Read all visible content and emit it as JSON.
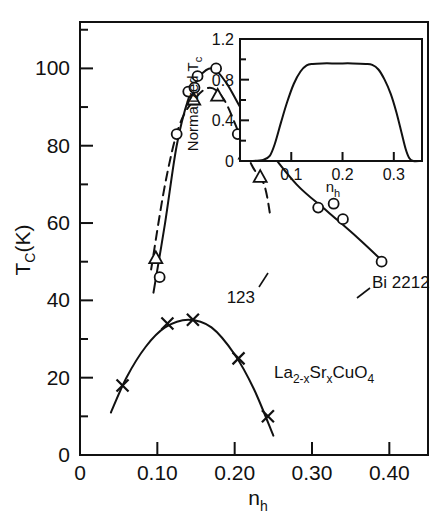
{
  "figure": {
    "background": "#ffffff",
    "ink": "#111111"
  },
  "main_axes": {
    "xlabel": "n",
    "xlabel_sub": "h",
    "ylabel": "T",
    "ylabel_sub": "C",
    "ylabel_unit": "(K)",
    "xticks": [
      "0",
      "0.10",
      "0.20",
      "0.30",
      "0.40"
    ],
    "xtick_values": [
      0,
      0.1,
      0.2,
      0.3,
      0.4
    ],
    "yticks": [
      "0",
      "20",
      "40",
      "60",
      "80",
      "100"
    ],
    "ytick_values": [
      0,
      20,
      40,
      60,
      80,
      100
    ],
    "xlim": [
      0,
      0.45
    ],
    "ylim": [
      0,
      112
    ],
    "minor_ticks": true,
    "grid": false,
    "frame": "box"
  },
  "annotations": {
    "bi2212": "Bi 2212",
    "y123": "123",
    "lsco_parts": [
      "La",
      "2-x",
      "Sr",
      "x",
      "CuO",
      "4"
    ],
    "lsco_plain": "La2-xSrxCuO4"
  },
  "inset_axes": {
    "ylabel": "Normalized T",
    "ylabel_sub": "c",
    "xlabel": "n",
    "xlabel_sub": "h",
    "xticks": [
      "0.1",
      "0.2",
      "0.3"
    ],
    "xtick_values": [
      0.1,
      0.2,
      0.3
    ],
    "yticks": [
      "0",
      "0.4",
      "0.8",
      "1.2"
    ],
    "ytick_values": [
      0,
      0.4,
      0.8,
      1.2
    ],
    "xlim": [
      0,
      0.355
    ],
    "ylim": [
      0,
      1.2
    ],
    "grid": false,
    "frame": "box"
  },
  "chart_data": [
    {
      "type": "scatter",
      "id": "main",
      "title": "",
      "xlabel": "n_h",
      "ylabel": "T_C (K)",
      "xlim": [
        0,
        0.45
      ],
      "ylim": [
        0,
        112
      ],
      "grid": false,
      "legend": "annotated-inline",
      "series": [
        {
          "name": "Bi 2212",
          "marker": "open-circle",
          "line": "solid",
          "points": [
            [
              0.103,
              46
            ],
            [
              0.125,
              83
            ],
            [
              0.14,
              94
            ],
            [
              0.148,
              95
            ],
            [
              0.152,
              98
            ],
            [
              0.176,
              100
            ],
            [
              0.204,
              83
            ],
            [
              0.308,
              64
            ],
            [
              0.328,
              65
            ],
            [
              0.34,
              61
            ],
            [
              0.39,
              50
            ]
          ],
          "curve": [
            [
              0.095,
              42
            ],
            [
              0.11,
              60
            ],
            [
              0.125,
              80
            ],
            [
              0.14,
              92
            ],
            [
              0.155,
              98
            ],
            [
              0.172,
              100
            ],
            [
              0.19,
              96
            ],
            [
              0.21,
              89
            ],
            [
              0.24,
              80
            ],
            [
              0.28,
              70
            ],
            [
              0.32,
              63
            ],
            [
              0.36,
              56
            ],
            [
              0.392,
              50
            ]
          ]
        },
        {
          "name": "123",
          "marker": "open-triangle",
          "line": "dashed",
          "points": [
            [
              0.098,
              51
            ],
            [
              0.147,
              92
            ],
            [
              0.178,
              93
            ],
            [
              0.214,
              78
            ],
            [
              0.233,
              72
            ]
          ],
          "curve": [
            [
              0.092,
              48
            ],
            [
              0.11,
              70
            ],
            [
              0.128,
              85
            ],
            [
              0.148,
              92
            ],
            [
              0.168,
              95
            ],
            [
              0.186,
              92
            ],
            [
              0.204,
              84
            ],
            [
              0.222,
              75
            ],
            [
              0.238,
              70
            ],
            [
              0.246,
              62
            ]
          ]
        },
        {
          "name": "La2-xSrxCuO4",
          "marker": "cross-x",
          "line": "solid",
          "points": [
            [
              0.055,
              18
            ],
            [
              0.113,
              34
            ],
            [
              0.146,
              35
            ],
            [
              0.205,
              25
            ],
            [
              0.243,
              10
            ]
          ],
          "curve": [
            [
              0.04,
              11
            ],
            [
              0.06,
              20
            ],
            [
              0.085,
              28
            ],
            [
              0.11,
              33
            ],
            [
              0.14,
              35
            ],
            [
              0.17,
              33
            ],
            [
              0.2,
              26
            ],
            [
              0.225,
              17
            ],
            [
              0.25,
              5
            ]
          ]
        }
      ]
    },
    {
      "type": "line",
      "id": "inset",
      "title": "",
      "xlabel": "n_h",
      "ylabel": "Normalized T_c",
      "xlim": [
        0,
        0.355
      ],
      "ylim": [
        0,
        1.2
      ],
      "grid": false,
      "series": [
        {
          "name": "normalized-tc",
          "line": "solid",
          "points": [
            [
              0.02,
              0.0
            ],
            [
              0.045,
              0.01
            ],
            [
              0.058,
              0.05
            ],
            [
              0.068,
              0.17
            ],
            [
              0.08,
              0.38
            ],
            [
              0.092,
              0.58
            ],
            [
              0.105,
              0.76
            ],
            [
              0.118,
              0.88
            ],
            [
              0.13,
              0.94
            ],
            [
              0.142,
              0.955
            ],
            [
              0.16,
              0.96
            ],
            [
              0.19,
              0.96
            ],
            [
              0.22,
              0.96
            ],
            [
              0.245,
              0.955
            ],
            [
              0.258,
              0.945
            ],
            [
              0.27,
              0.9
            ],
            [
              0.282,
              0.8
            ],
            [
              0.294,
              0.66
            ],
            [
              0.305,
              0.48
            ],
            [
              0.315,
              0.28
            ],
            [
              0.323,
              0.12
            ],
            [
              0.33,
              0.03
            ],
            [
              0.338,
              0.0
            ],
            [
              0.352,
              0.0
            ]
          ]
        }
      ]
    }
  ]
}
